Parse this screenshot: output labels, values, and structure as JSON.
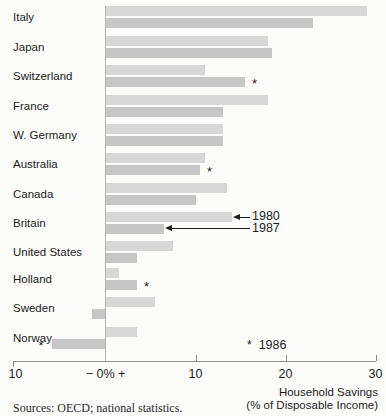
{
  "colors": {
    "bar_1980": "#d7d7d7",
    "bar_1987": "#c6c6c6",
    "axis": "#8f8f8f",
    "zero_line": "#b3b3b3",
    "text": "#1d1d1d",
    "background": "#fcfcfa"
  },
  "chart_data": {
    "type": "bar",
    "orientation": "horizontal",
    "title": "",
    "xlabel": "Household Savings (% of Disposable Income)",
    "x_axis": {
      "min": -10,
      "max": 30,
      "tick_values": [
        -10,
        0,
        10,
        20,
        30
      ],
      "tick_labels": [
        "10",
        "− 0% +",
        "10",
        "20",
        "30"
      ]
    },
    "series_names": [
      "1980",
      "1987"
    ],
    "categories": [
      "Italy",
      "Japan",
      "Switzerland",
      "France",
      "W. Germany",
      "Australia",
      "Canada",
      "Britain",
      "United States",
      "Holland",
      "Sweden",
      "Norway"
    ],
    "countries": [
      {
        "name": "Italy",
        "v1980": 29,
        "v1987": 23,
        "note1986": false
      },
      {
        "name": "Japan",
        "v1980": 18,
        "v1987": 18.5,
        "note1986": false
      },
      {
        "name": "Switzerland",
        "v1980": 11,
        "v1987": 15.5,
        "note1986": true
      },
      {
        "name": "France",
        "v1980": 18,
        "v1987": 13,
        "note1986": false
      },
      {
        "name": "W. Germany",
        "v1980": 13,
        "v1987": 13,
        "note1986": false
      },
      {
        "name": "Australia",
        "v1980": 11,
        "v1987": 10.5,
        "note1986": true
      },
      {
        "name": "Canada",
        "v1980": 13.5,
        "v1987": 10,
        "note1986": false
      },
      {
        "name": "Britain",
        "v1980": 14,
        "v1987": 6.5,
        "note1986": false,
        "callout": true
      },
      {
        "name": "United States",
        "v1980": 7.5,
        "v1987": 3.5,
        "note1986": false
      },
      {
        "name": "Holland",
        "v1980": 1.5,
        "v1987": 3.5,
        "note1986": true
      },
      {
        "name": "Sweden",
        "v1980": 5.5,
        "v1987": -1.5,
        "note1986": false
      },
      {
        "name": "Norway",
        "v1980": 3.5,
        "v1987": -6,
        "note1986": true,
        "note_side": "left"
      }
    ],
    "annotations": {
      "callout_1980": "1980",
      "callout_1987": "1987",
      "note_marker": "*",
      "note_1986_label": "1986"
    },
    "legend_position": "callout-on-britain-bars",
    "grid": false
  },
  "footer": {
    "line1": "Household Savings",
    "line2": "(% of Disposable Income)"
  },
  "source": "Sources: OECD; national statistics."
}
